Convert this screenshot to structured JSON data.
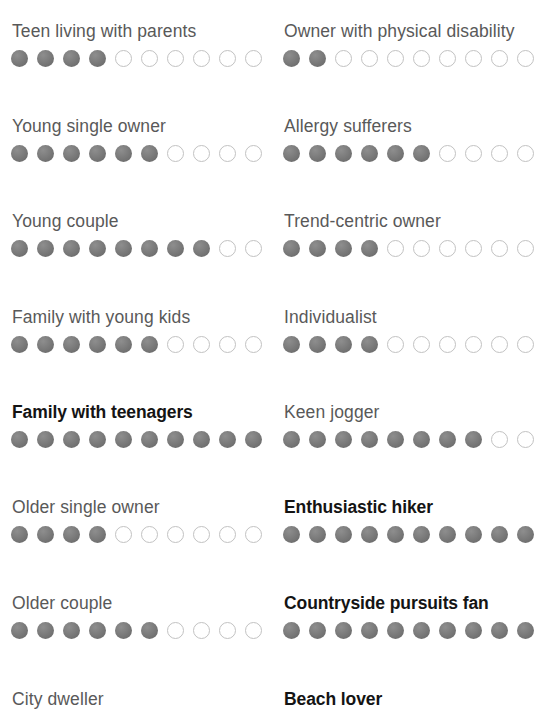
{
  "scale": {
    "max": 10,
    "filled_color": "#757575",
    "empty_color": "#ffffff",
    "empty_border_color": "#c2c2c2",
    "label_color": "#595959",
    "emphasis_label_color": "#141414",
    "background_color": "#ffffff"
  },
  "chart_data": {
    "type": "bar",
    "title": "",
    "subtitle": "",
    "xlabel": "",
    "ylabel": "",
    "ylim": [
      0,
      10
    ],
    "grid": false,
    "legend": null,
    "categories": [
      "Teen living with parents",
      "Young single owner",
      "Young couple",
      "Family with young kids",
      "Family with teenagers",
      "Older single owner",
      "Older couple",
      "City dweller",
      "Owner with physical disability",
      "Allergy sufferers",
      "Trend-centric owner",
      "Individualist",
      "Keen jogger",
      "Enthusiastic hiker",
      "Countryside pursuits fan",
      "Beach lover"
    ],
    "values": [
      4,
      6,
      8,
      6,
      10,
      4,
      6,
      null,
      2,
      6,
      4,
      4,
      8,
      10,
      10,
      null
    ]
  },
  "columns": [
    {
      "id": "left",
      "rows": [
        {
          "label": "Teen living with parents",
          "filled": 4,
          "total": 10,
          "emphasis": false,
          "cropped": false
        },
        {
          "label": "Young single owner",
          "filled": 6,
          "total": 10,
          "emphasis": false,
          "cropped": false
        },
        {
          "label": "Young couple",
          "filled": 8,
          "total": 10,
          "emphasis": false,
          "cropped": false
        },
        {
          "label": "Family with young kids",
          "filled": 6,
          "total": 10,
          "emphasis": false,
          "cropped": false
        },
        {
          "label": "Family with teenagers",
          "filled": 10,
          "total": 10,
          "emphasis": true,
          "cropped": false
        },
        {
          "label": "Older single owner",
          "filled": 4,
          "total": 10,
          "emphasis": false,
          "cropped": false
        },
        {
          "label": "Older couple",
          "filled": 6,
          "total": 10,
          "emphasis": false,
          "cropped": false
        },
        {
          "label": "City dweller",
          "filled": 0,
          "total": 0,
          "emphasis": false,
          "cropped": true
        }
      ]
    },
    {
      "id": "right",
      "rows": [
        {
          "label": "Owner with physical disability",
          "filled": 2,
          "total": 10,
          "emphasis": false,
          "cropped": false
        },
        {
          "label": "Allergy sufferers",
          "filled": 6,
          "total": 10,
          "emphasis": false,
          "cropped": false
        },
        {
          "label": "Trend-centric owner",
          "filled": 4,
          "total": 10,
          "emphasis": false,
          "cropped": false
        },
        {
          "label": "Individualist",
          "filled": 4,
          "total": 10,
          "emphasis": false,
          "cropped": false
        },
        {
          "label": "Keen jogger",
          "filled": 8,
          "total": 10,
          "emphasis": false,
          "cropped": false
        },
        {
          "label": "Enthusiastic hiker",
          "filled": 10,
          "total": 10,
          "emphasis": true,
          "cropped": false
        },
        {
          "label": "Countryside pursuits fan",
          "filled": 10,
          "total": 10,
          "emphasis": true,
          "cropped": false
        },
        {
          "label": "Beach lover",
          "filled": 0,
          "total": 0,
          "emphasis": true,
          "cropped": true
        }
      ]
    }
  ]
}
